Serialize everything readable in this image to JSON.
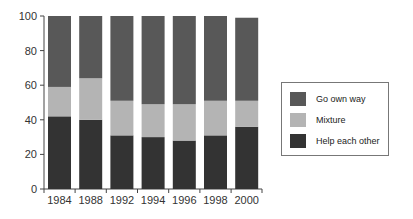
{
  "chart_data": {
    "type": "bar",
    "stacked": true,
    "title": "",
    "xlabel": "",
    "ylabel": "",
    "ylim": [
      0,
      100
    ],
    "yticks": [
      0,
      20,
      40,
      60,
      80,
      100
    ],
    "categories": [
      "1984",
      "1988",
      "1992",
      "1994",
      "1996",
      "1998",
      "2000"
    ],
    "series": [
      {
        "name": "Help each other",
        "color": "#333333",
        "values": [
          42,
          40,
          31,
          30,
          28,
          31,
          36
        ]
      },
      {
        "name": "Mixture",
        "color": "#b4b4b4",
        "values": [
          17,
          24,
          20,
          19,
          21,
          20,
          15
        ]
      },
      {
        "name": "Go own way",
        "color": "#585858",
        "values": [
          41,
          36,
          49,
          51,
          51,
          49,
          48
        ]
      }
    ],
    "legend": {
      "position": "right",
      "entries": [
        "Go own way",
        "Mixture",
        "Help each other"
      ]
    },
    "grid": false
  },
  "legend": {
    "items": [
      {
        "label": "Go own way",
        "color": "#585858"
      },
      {
        "label": "Mixture",
        "color": "#b4b4b4"
      },
      {
        "label": "Help each other",
        "color": "#333333"
      }
    ]
  }
}
